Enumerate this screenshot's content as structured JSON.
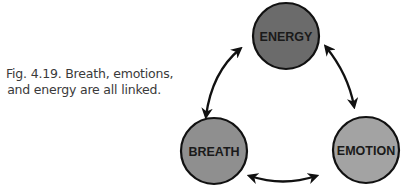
{
  "caption": {
    "line1": "Fig. 4.19. Breath, emotions,",
    "line2": "and energy are all linked."
  },
  "nodes": [
    {
      "id": "energy",
      "label": "ENERGY",
      "fill": "#6b6b6b"
    },
    {
      "id": "breath",
      "label": "BREATH",
      "fill": "#8f8f8f"
    },
    {
      "id": "emotion",
      "label": "EMOTION",
      "fill": "#a3a3a3"
    }
  ],
  "edges": [
    {
      "from": "breath",
      "to": "energy",
      "bidirectional": true
    },
    {
      "from": "energy",
      "to": "emotion",
      "bidirectional": true
    },
    {
      "from": "breath",
      "to": "emotion",
      "bidirectional": true
    }
  ],
  "colors": {
    "stroke": "#111111",
    "arrow": "#111111",
    "caption_text": "#3a3a3a"
  }
}
